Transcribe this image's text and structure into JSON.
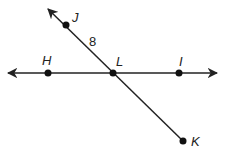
{
  "diagram": {
    "type": "geometry-lines",
    "lines": [
      {
        "name": "line-HI",
        "through": [
          "H",
          "L",
          "I"
        ],
        "style": "double-arrow"
      },
      {
        "name": "ray-LJ-line",
        "through": [
          "J",
          "L",
          "K"
        ],
        "style": "arrow-at-J-end"
      }
    ],
    "points": {
      "J": {
        "label": "J"
      },
      "H": {
        "label": "H"
      },
      "L": {
        "label": "L"
      },
      "I": {
        "label": "I"
      },
      "K": {
        "label": "K"
      }
    },
    "measure": {
      "segment": "JL",
      "value": "8"
    },
    "colors": {
      "stroke": "#222222",
      "background": "#ffffff"
    }
  }
}
